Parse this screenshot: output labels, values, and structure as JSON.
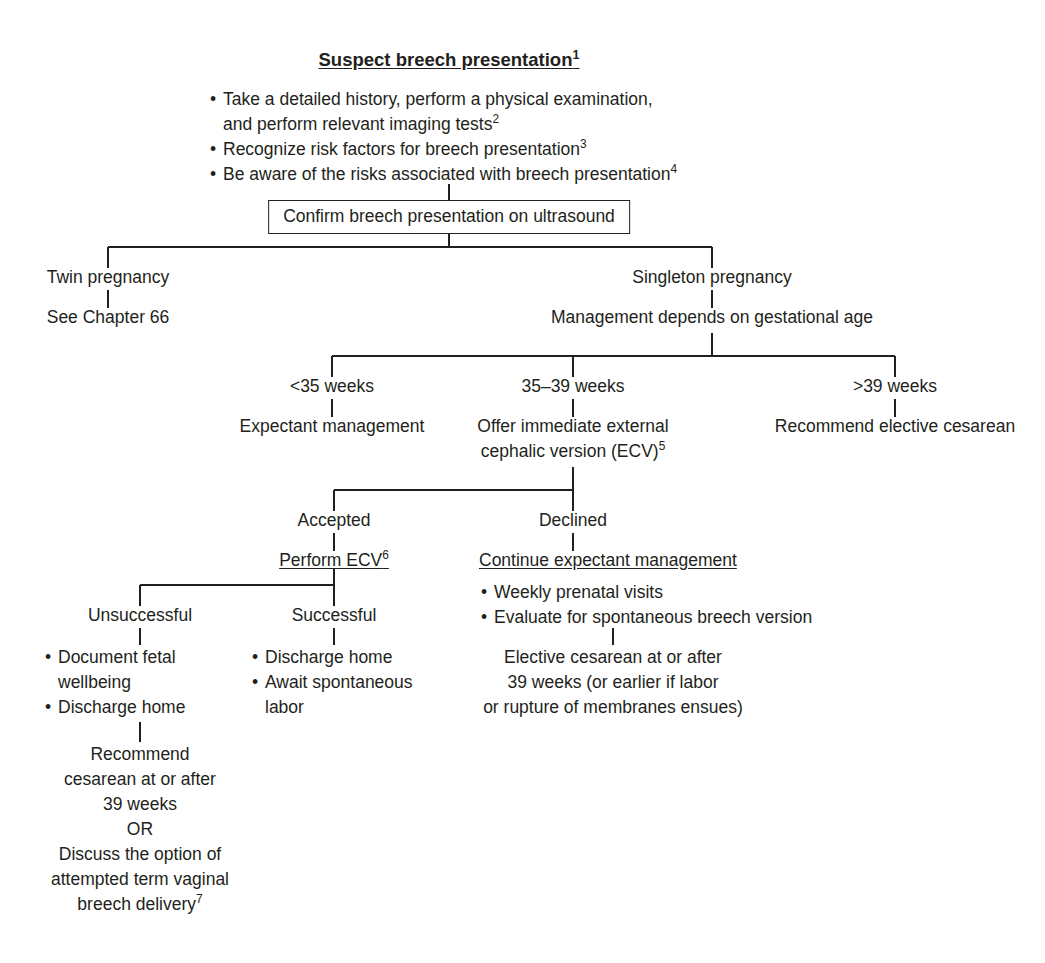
{
  "document": {
    "kind": "clinical-algorithm-flowchart",
    "topic": "Suspect breech presentation"
  },
  "colors": {
    "ink": "#231f20",
    "line": "#231f20",
    "background": "#ffffff"
  },
  "header": {
    "title": "Suspect breech presentation",
    "title_superscript": "1",
    "bullets": [
      {
        "text": "Take a detailed history, perform a physical examination,",
        "superscript": ""
      },
      {
        "text": "and perform relevant imaging tests",
        "superscript": "2",
        "continuation": true
      },
      {
        "text": "Recognize risk factors for breech presentation",
        "superscript": "3"
      },
      {
        "text": "Be aware of the risks associated with breech presentation",
        "superscript": "4"
      }
    ]
  },
  "confirm_box": {
    "label": "Confirm breech presentation on ultrasound"
  },
  "branch_pregnancy": {
    "twin": {
      "label": "Twin pregnancy",
      "action": "See Chapter 66"
    },
    "singleton": {
      "label": "Singleton pregnancy",
      "action": "Management depends on gestational age"
    }
  },
  "gestational_age": {
    "lt35": {
      "label": "<35 weeks",
      "action": "Expectant management"
    },
    "w35_39": {
      "label": "35–39 weeks",
      "action_line1": "Offer immediate external",
      "action_line2": "cephalic version (ECV)",
      "action_superscript": "5"
    },
    "gt39": {
      "label": ">39 weeks",
      "action": "Recommend elective cesarean"
    }
  },
  "ecv_offer": {
    "accepted": {
      "label": "Accepted",
      "action": "Perform ECV",
      "action_superscript": "6"
    },
    "declined": {
      "label": "Declined",
      "action": "Continue expectant management",
      "bullets": [
        "Weekly prenatal visits",
        "Evaluate for spontaneous breech version"
      ],
      "outcome_lines": [
        "Elective cesarean at or after",
        "39 weeks (or earlier if labor",
        "or rupture of membranes ensues)"
      ]
    }
  },
  "ecv_result": {
    "unsuccessful": {
      "label": "Unsuccessful",
      "bullets": [
        {
          "text": "Document fetal",
          "dot": true
        },
        {
          "text": "wellbeing",
          "dot": false
        },
        {
          "text": "Discharge home",
          "dot": true
        }
      ],
      "outcome_lines": [
        "Recommend",
        "cesarean at or after",
        "39 weeks",
        "OR",
        "Discuss the option of",
        "attempted term vaginal",
        "breech delivery"
      ],
      "outcome_superscript": "7"
    },
    "successful": {
      "label": "Successful",
      "bullets": [
        {
          "text": "Discharge home",
          "dot": true
        },
        {
          "text": "Await spontaneous",
          "dot": true
        },
        {
          "text": "labor",
          "dot": false
        }
      ]
    }
  }
}
